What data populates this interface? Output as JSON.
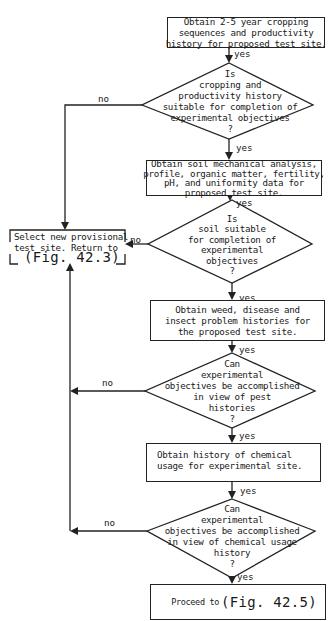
{
  "flowchart": {
    "steps": [
      {
        "id": "box1",
        "type": "process",
        "lines": [
          "Obtain 2-5 year cropping",
          "sequences and productivity",
          "history for proposed test site."
        ]
      },
      {
        "id": "dec1",
        "type": "decision",
        "lines": [
          "Is",
          "cropping and",
          "productivity history",
          "suitable for completion of",
          "experimental objectives",
          "?"
        ]
      },
      {
        "id": "box2",
        "type": "process",
        "lines": [
          "Obtain soil mechanical analysis,",
          "profile, organic matter, fertility,",
          "pH, and uniformity data for",
          "proposed test site."
        ]
      },
      {
        "id": "dec2",
        "type": "decision",
        "lines": [
          "Is",
          "soil suitable",
          "for completion of",
          "experimental",
          "objectives",
          "?"
        ]
      },
      {
        "id": "box3",
        "type": "process",
        "lines": [
          "Obtain weed, disease and",
          "insect problem histories for",
          "the proposed test site."
        ]
      },
      {
        "id": "dec3",
        "type": "decision",
        "lines": [
          "Can",
          "experimental",
          "objectives be accomplished",
          "in view of pest",
          "histories",
          "?"
        ]
      },
      {
        "id": "box4",
        "type": "process",
        "lines": [
          "Obtain history of chemical",
          "usage for experimental site."
        ]
      },
      {
        "id": "dec4",
        "type": "decision",
        "lines": [
          "Can",
          "experimental",
          "objectives be accomplished",
          "in view of chemical usage",
          "history",
          "?"
        ]
      },
      {
        "id": "end",
        "type": "terminal",
        "prefix": "Proceed to",
        "ref": "(Fig. 42.5)"
      }
    ],
    "reject": {
      "lines": [
        "Select new provisional",
        "test site.  Return to"
      ],
      "ref": "(Fig. 42.3)"
    },
    "edge_labels": {
      "yes": "yes",
      "no": "no"
    }
  },
  "colors": {
    "line": "#222222",
    "background": "#ffffff"
  }
}
